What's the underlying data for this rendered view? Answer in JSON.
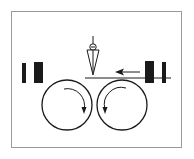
{
  "diagram": {
    "colors": {
      "stroke": "#1a1a1a",
      "frame": "#9a9a9a",
      "background": "#ffffff"
    },
    "frame": {
      "x": 11,
      "y": 11,
      "width": 171,
      "height": 137
    },
    "feed_line": {
      "x1": 85,
      "y1": 78,
      "x2": 171,
      "y2": 78
    },
    "feed_arrow": {
      "direction": "left",
      "x_from": 140,
      "x_to": 116,
      "y": 72
    },
    "left_blocks": [
      {
        "x": 22,
        "y": 63,
        "w": 4,
        "h": 20
      },
      {
        "x": 34,
        "y": 62,
        "w": 9,
        "h": 21
      }
    ],
    "right_blocks": [
      {
        "x": 145,
        "y": 61,
        "w": 9,
        "h": 22
      },
      {
        "x": 162,
        "y": 62,
        "w": 4,
        "h": 21
      }
    ],
    "rollers": [
      {
        "name": "left-roller",
        "cx": 67,
        "cy": 105,
        "r": 25,
        "rotation": "clockwise"
      },
      {
        "name": "right-roller",
        "cx": 122,
        "cy": 105,
        "r": 25,
        "rotation": "counterclockwise"
      }
    ],
    "cutter": {
      "name": "blade-tool",
      "tip_x": 93,
      "tip_y": 75,
      "top_y": 36
    }
  }
}
